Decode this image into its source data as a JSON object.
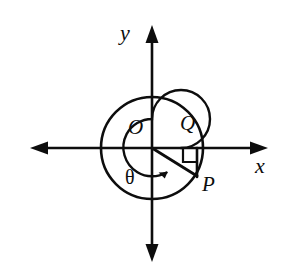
{
  "figure": {
    "kind": "geometry-diagram",
    "background_color": "#ffffff",
    "stroke_color": "#0d0d0d"
  },
  "axes": {
    "origin": {
      "x": 152,
      "y": 148
    },
    "x_axis": {
      "label": "x",
      "label_x": 258,
      "label_y": 157,
      "start_x": 30,
      "end_x": 268,
      "y": 148,
      "arrow_left": true,
      "arrow_right": true
    },
    "y_axis": {
      "label": "y",
      "label_x": 122,
      "label_y": 25,
      "x": 152,
      "start_y": 25,
      "end_y": 262,
      "arrow_up": true,
      "arrow_down": true
    }
  },
  "circles": [
    {
      "name": "outer-circle",
      "cx": 152,
      "cy": 148,
      "r": 51
    },
    {
      "name": "inner-angle-arc",
      "cx": 152,
      "cy": 148,
      "r": 29,
      "sweep_start_deg": 0,
      "sweep_end_deg": 331,
      "direction": "counterclockwise",
      "has_arrowhead": true
    }
  ],
  "points": {
    "origin": {
      "label": "O",
      "x": 152,
      "y": 148,
      "label_x": 129,
      "label_y": 118
    },
    "terminal": {
      "label": "P",
      "x": 197,
      "y": 176,
      "label_x": 203,
      "label_y": 175
    },
    "foot": {
      "label": "Q",
      "x": 197,
      "y": 148,
      "label_x": 181,
      "label_y": 114
    }
  },
  "segments": [
    {
      "name": "radius-OP",
      "from": "O",
      "to": "P",
      "x1": 152,
      "y1": 148,
      "x2": 197,
      "y2": 176
    },
    {
      "name": "perpendicular-QP",
      "from": "Q",
      "to": "P",
      "x1": 197,
      "y1": 148,
      "x2": 197,
      "y2": 176
    }
  ],
  "angle": {
    "label": "θ",
    "label_x": 126,
    "label_y": 168,
    "measure_note": "angle from positive x-axis, counterclockwise"
  },
  "right_angle_mark": {
    "name": "right-angle-at-Q",
    "x": 183,
    "y": 148,
    "size": 14
  }
}
